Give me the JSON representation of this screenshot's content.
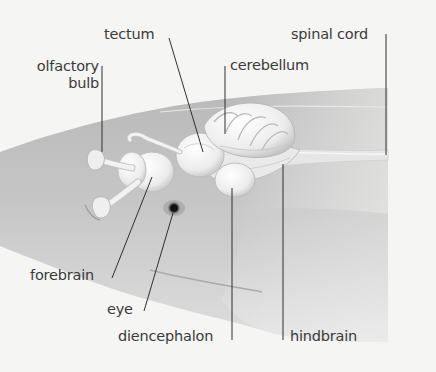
{
  "diagram": {
    "colors": {
      "background": "#f5f5f3",
      "body_fill": "#bdbdbd",
      "body_light": "#e2e2e2",
      "brain_fill": "#f1f1f1",
      "brain_shade": "#c8c8c8",
      "leader_line": "#2f2f2f",
      "label_text": "#3a3a3a",
      "eye": "#222222"
    },
    "labels": {
      "tectum": "tectum",
      "spinal_cord": "spinal cord",
      "olfactory_bulb_line1": "olfactory",
      "olfactory_bulb_line2": "bulb",
      "cerebellum": "cerebellum",
      "forebrain": "forebrain",
      "eye": "eye",
      "diencephalon": "diencephalon",
      "hindbrain": "hindbrain"
    }
  }
}
